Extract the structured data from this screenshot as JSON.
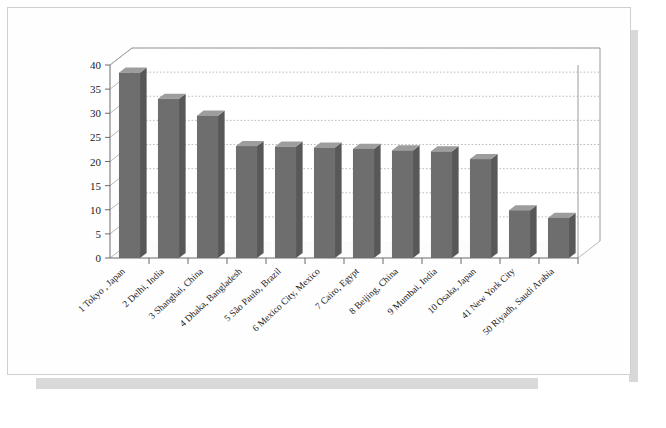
{
  "chart_data": {
    "type": "bar",
    "title": "",
    "xlabel": "",
    "ylabel": "",
    "ylim": [
      0,
      40
    ],
    "ytick_step": 5,
    "yticks": [
      "0",
      "5",
      "10",
      "15",
      "20",
      "25",
      "30",
      "35",
      "40"
    ],
    "grid": true,
    "legend": "none",
    "style": "3d-column-grayscale",
    "bar_color": "#6e6e6e",
    "bar_top_color": "#9d9d9d",
    "gridline_color": "#b4b4b4",
    "categories": [
      "1 Tokyo , Japan",
      "2 Delhi, India",
      "3 Shanghai, China",
      "4 Dhaka, Bangladesh",
      "5 São Paulo, Brazil",
      "6 Mexico City, Mexico",
      "7 Cairo, Egypt",
      "8 Beijing, China",
      "9 Mumbai, India",
      "10 Osaka, Japan",
      "41 New York City",
      "50 Riyadh, Saudi Arabia"
    ],
    "values": [
      38.4,
      33.0,
      29.5,
      23.2,
      23.1,
      22.9,
      22.6,
      22.3,
      22.1,
      20.5,
      9.9,
      8.3
    ]
  }
}
